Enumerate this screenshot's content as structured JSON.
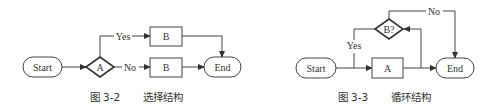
{
  "figures": [
    {
      "id": "fig-3-2",
      "caption_number": "图 3-2",
      "caption_title": "选择结构",
      "nodes": {
        "start": "Start",
        "decision": "A",
        "branch_yes": "B",
        "branch_no": "B",
        "end": "End"
      },
      "edges": {
        "yes_label": "Yes",
        "no_label": "No"
      }
    },
    {
      "id": "fig-3-3",
      "caption_number": "图 3-3",
      "caption_title": "循环结构",
      "nodes": {
        "start": "Start",
        "process": "A",
        "decision": "B?",
        "end": "End"
      },
      "edges": {
        "yes_label": "Yes",
        "no_label": "No"
      }
    }
  ],
  "colors": {
    "stroke": "#444444",
    "text": "#333333",
    "background": "#ffffff"
  }
}
